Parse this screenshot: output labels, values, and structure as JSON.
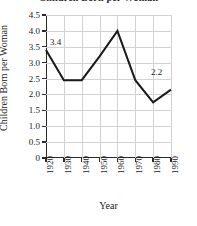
{
  "chart_data": {
    "type": "line",
    "title": "Children Born per Woman",
    "title_clipped": true,
    "xlabel": "Year",
    "ylabel": "Children Born per Woman",
    "x": [
      1920,
      1930,
      1940,
      1950,
      1960,
      1970,
      1980,
      1990
    ],
    "categories": [
      "1920",
      "1930",
      "1940",
      "1950",
      "1960",
      "1970",
      "1980",
      "1990"
    ],
    "values": [
      3.4,
      2.45,
      2.45,
      3.2,
      4.0,
      2.45,
      1.75,
      2.15
    ],
    "xlim": [
      1920,
      1990
    ],
    "ylim": [
      0,
      4.5
    ],
    "ytick_labels": [
      "4.5",
      "4.0",
      "3.5",
      "3.0",
      "2.5",
      "2.0",
      "1.5",
      "1.0",
      "0.5",
      "0"
    ],
    "ytick_values": [
      4.5,
      4.0,
      3.5,
      3.0,
      2.5,
      2.0,
      1.5,
      1.0,
      0.5,
      0
    ],
    "xtick_labels": [
      "1920",
      "1930",
      "1940",
      "1950",
      "1960",
      "1970",
      "1980",
      "1990"
    ],
    "xtick_values": [
      1920,
      1930,
      1940,
      1950,
      1960,
      1970,
      1980,
      1990
    ],
    "grid": true,
    "grid_color": "#d2d2d2",
    "legend": false,
    "line_color": "#1a1a1a",
    "line_width": 2.0,
    "markers": false,
    "annotations": [
      {
        "label": "3.4",
        "x": 1920,
        "y": 3.4
      },
      {
        "label": "2.2",
        "x": 1990,
        "y": 2.15
      }
    ]
  },
  "axes": {
    "y_title": "Children Born per Woman",
    "x_title": "Year"
  }
}
